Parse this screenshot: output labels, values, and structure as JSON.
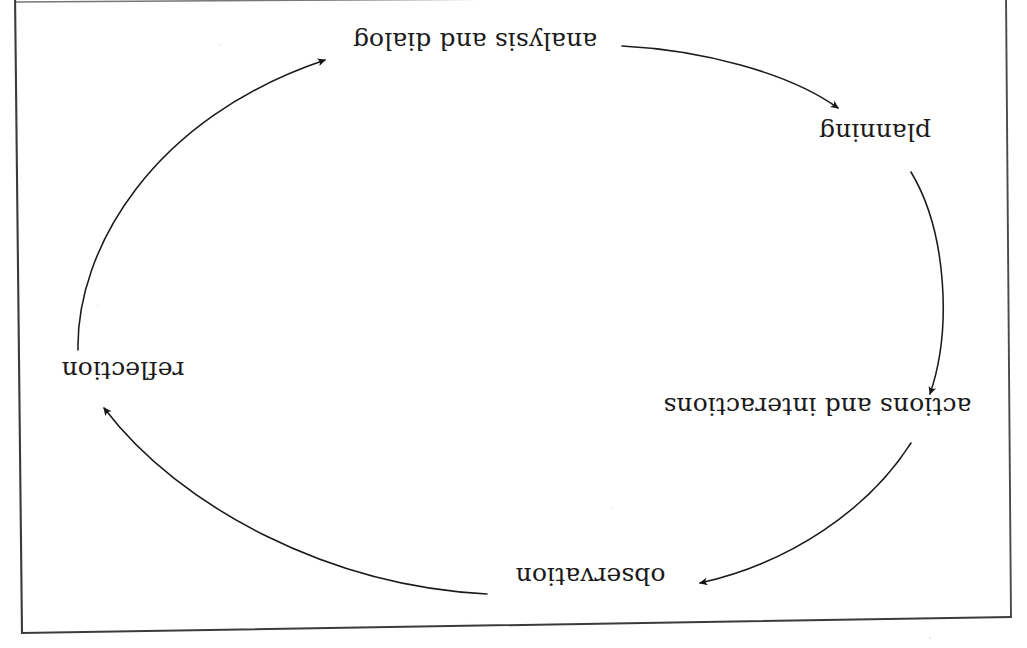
{
  "page": {
    "orientation": "upside-down scan",
    "background_color": "#ffffff",
    "ink_color": "#1a1a1a",
    "frame_color": "#3a3a3a"
  },
  "diagram": {
    "type": "cycle",
    "shape": "ellipse",
    "direction": "clockwise-in-page-coordinates",
    "node_count": 5,
    "arrow_count": 5,
    "nodes": [
      {
        "id": "analysis-and-dialog",
        "label": "analysis and dialog",
        "order": 1,
        "x": 475,
        "y": 45
      },
      {
        "id": "planning",
        "label": "planning",
        "order": 2,
        "x": 872,
        "y": 137
      },
      {
        "id": "actions-and-interactions",
        "label": "actions and interactions",
        "order": 3,
        "x": 817,
        "y": 412
      },
      {
        "id": "observation",
        "label": "observation",
        "order": 4,
        "x": 590,
        "y": 582
      },
      {
        "id": "reflection",
        "label": "reflection",
        "order": 5,
        "x": 122,
        "y": 375
      }
    ],
    "arrows": [
      {
        "id": "arrow-analysis-to-planning",
        "from": "analysis and dialog",
        "to": "planning"
      },
      {
        "id": "arrow-planning-to-actions",
        "from": "planning",
        "to": "actions and interactions"
      },
      {
        "id": "arrow-actions-to-observation",
        "from": "actions and interactions",
        "to": "observation"
      },
      {
        "id": "arrow-observation-to-reflection",
        "from": "observation",
        "to": "reflection"
      },
      {
        "id": "arrow-reflection-to-analysis",
        "from": "reflection",
        "to": "analysis and dialog"
      }
    ]
  }
}
